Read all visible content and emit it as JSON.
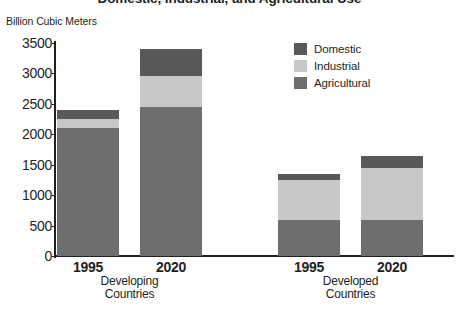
{
  "chart_data": {
    "type": "bar",
    "subtype": "stacked",
    "title": "Domestic, Industrial, and Agricultural Use",
    "ylabel": "Billion Cubic Meters",
    "xlabel": "",
    "ylim": [
      0,
      3500
    ],
    "yticks": [
      0,
      500,
      1000,
      1500,
      2000,
      2500,
      3000,
      3500
    ],
    "ytick_labels": [
      "0",
      "500",
      "1000",
      "1500",
      "2000",
      "2500",
      "3000",
      "3500"
    ],
    "grid": false,
    "legend_position": "top-right",
    "categories": [
      "1995",
      "2020",
      "1995",
      "2020"
    ],
    "groups": [
      {
        "name": "Developing Countries",
        "line1": "Developing",
        "line2": "Countries",
        "categories": [
          "1995",
          "2020"
        ]
      },
      {
        "name": "Developed Countries",
        "line1": "Developed",
        "line2": "Countries",
        "categories": [
          "1995",
          "2020"
        ]
      }
    ],
    "series": [
      {
        "name": "Agricultural",
        "color": "#6d6e70",
        "values": [
          2100,
          2450,
          600,
          600
        ]
      },
      {
        "name": "Industrial",
        "color": "#c7c8ca",
        "values": [
          150,
          500,
          650,
          850
        ]
      },
      {
        "name": "Domestic",
        "color": "#58595b",
        "values": [
          150,
          450,
          100,
          200
        ]
      }
    ],
    "totals": [
      2400,
      3400,
      1350,
      1650
    ],
    "bars": [
      {
        "group": "Developing Countries",
        "year": "1995",
        "agricultural": 2100,
        "industrial": 150,
        "domestic": 150,
        "total": 2400
      },
      {
        "group": "Developing Countries",
        "year": "2020",
        "agricultural": 2450,
        "industrial": 500,
        "domestic": 450,
        "total": 3400
      },
      {
        "group": "Developed Countries",
        "year": "1995",
        "agricultural": 600,
        "industrial": 650,
        "domestic": 100,
        "total": 1350
      },
      {
        "group": "Developed Countries",
        "year": "2020",
        "agricultural": 600,
        "industrial": 850,
        "domestic": 200,
        "total": 1650
      }
    ],
    "legend": [
      {
        "label": "Domestic",
        "color": "#58595b"
      },
      {
        "label": "Industrial",
        "color": "#c7c8ca"
      },
      {
        "label": "Agricultural",
        "color": "#6d6e70"
      }
    ]
  }
}
